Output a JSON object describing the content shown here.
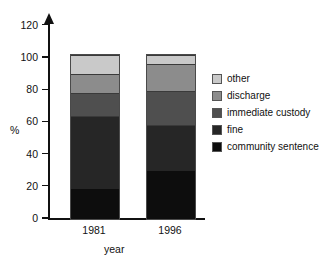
{
  "chart_data": {
    "type": "bar",
    "stacked": true,
    "title": "",
    "xlabel": "year",
    "ylabel": "%",
    "categories": [
      "1981",
      "1996"
    ],
    "ylim": [
      0,
      120
    ],
    "yticks": [
      0,
      20,
      40,
      60,
      80,
      100,
      120
    ],
    "grid": false,
    "legend_position": "right",
    "series": [
      {
        "name": "community sentence",
        "color": "#0d0d0d",
        "values": [
          18.5,
          30.0
        ]
      },
      {
        "name": "fine",
        "color": "#262626",
        "values": [
          45.5,
          28.5
        ]
      },
      {
        "name": "immediate custody",
        "color": "#4f4f4f",
        "values": [
          14.0,
          21.0
        ]
      },
      {
        "name": "discharge",
        "color": "#8c8c8c",
        "values": [
          12.0,
          17.0
        ]
      },
      {
        "name": "other",
        "color": "#c9c9c9",
        "values": [
          12.0,
          5.5
        ]
      }
    ],
    "stack_totals": [
      102.0,
      102.0
    ],
    "legend_order": [
      "other",
      "discharge",
      "immediate custody",
      "fine",
      "community sentence"
    ]
  },
  "axis": {
    "y_tick_labels": [
      "120",
      "100",
      "80",
      "60",
      "40",
      "20",
      "0"
    ],
    "y_title": "%",
    "x_title": "year",
    "x_tick_labels": [
      "1981",
      "1996"
    ]
  },
  "legend": {
    "items": [
      {
        "label": "other",
        "color": "#c9c9c9"
      },
      {
        "label": "discharge",
        "color": "#8c8c8c"
      },
      {
        "label": "immediate custody",
        "color": "#4f4f4f"
      },
      {
        "label": "fine",
        "color": "#262626"
      },
      {
        "label": "community sentence",
        "color": "#0d0d0d"
      }
    ]
  }
}
